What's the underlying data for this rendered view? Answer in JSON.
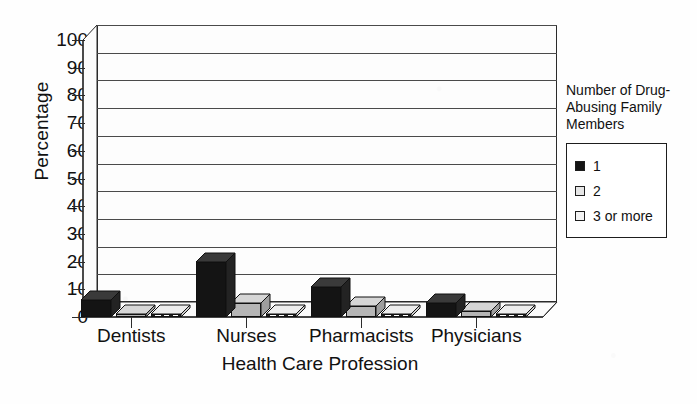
{
  "chart_data": {
    "type": "bar",
    "title": "",
    "xlabel": "Health Care Profession",
    "ylabel": "Percentage",
    "categories": [
      "Dentists",
      "Nurses",
      "Pharmacists",
      "Physicians"
    ],
    "series": [
      {
        "name": "1",
        "values": [
          6,
          20,
          11,
          5
        ]
      },
      {
        "name": "2",
        "values": [
          1,
          5,
          4,
          2
        ]
      },
      {
        "name": "3 or more",
        "values": [
          1,
          1,
          1,
          1
        ]
      }
    ],
    "ylim": [
      0,
      100
    ],
    "yticks": [
      0,
      10,
      20,
      30,
      40,
      50,
      60,
      70,
      80,
      90,
      100
    ],
    "ytick_labels": [
      "0",
      "10",
      "20",
      "30",
      "40",
      "50",
      "60",
      "70",
      "80",
      "90",
      "100"
    ],
    "grid": true,
    "grid_axis": "y",
    "legend_position": "right",
    "legend_title": "Number of Drug-Abusing Family Members",
    "style": "3d-column",
    "colors": {
      "series_1": "#141414",
      "series_2": "#b5b5b5",
      "series_3": "#ffffff",
      "axis": "#2b2b2b",
      "grid": "#4a4a4a",
      "background": "#fefefe"
    }
  },
  "legend": {
    "title_lines": [
      "Number of Drug-",
      "Abusing Family",
      "Members"
    ],
    "entries": [
      {
        "label": "1",
        "swatch": "solid-black-square-icon"
      },
      {
        "label": "2",
        "swatch": "light-gray-square-icon"
      },
      {
        "label": "3 or more",
        "swatch": "white-square-icon"
      }
    ]
  }
}
